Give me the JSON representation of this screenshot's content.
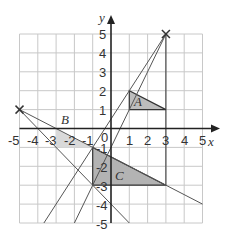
{
  "diagram": {
    "type": "coordinate-grid-enlargement",
    "x_axis": {
      "label": "x",
      "min": -5,
      "max": 5,
      "ticks": [
        "-5",
        "-4",
        "-3",
        "-2",
        "-1",
        "0",
        "1",
        "2",
        "3",
        "4",
        "5"
      ]
    },
    "y_axis": {
      "label": "y",
      "min": -5,
      "max": 5,
      "ticks": [
        "5",
        "4",
        "3",
        "2",
        "1",
        "-1",
        "-2",
        "-3",
        "-4",
        "-5"
      ]
    },
    "origin_label": "0",
    "shapes": [
      {
        "label": "A",
        "vertices": [
          [
            1,
            1
          ],
          [
            1,
            2
          ],
          [
            3,
            1
          ]
        ],
        "fill": "#bdbdbd"
      },
      {
        "label": "B",
        "vertices": [
          [
            -3,
            0
          ],
          [
            -3,
            -1
          ],
          [
            -1,
            -1
          ]
        ],
        "fill": "#d9d9d9"
      },
      {
        "label": "C",
        "vertices": [
          [
            -1,
            -1
          ],
          [
            -1,
            -3
          ],
          [
            3,
            -3
          ]
        ],
        "fill": "#b3b3b3"
      }
    ],
    "centres": [
      {
        "mark": "x",
        "point": [
          3,
          5
        ]
      },
      {
        "mark": "x",
        "point": [
          -5,
          1
        ]
      }
    ],
    "colors": {
      "grid": "#c8c8c8",
      "axis": "#222222",
      "construction_line": "#555555",
      "edge": "#333333"
    }
  }
}
